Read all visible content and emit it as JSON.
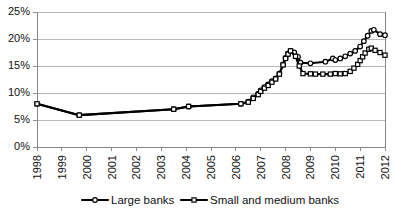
{
  "chart_data": {
    "type": "line",
    "title": "",
    "xlabel": "",
    "ylabel": "",
    "ylim": [
      0,
      25
    ],
    "ytick_labels": [
      "0%",
      "5%",
      "10%",
      "15%",
      "20%",
      "25%"
    ],
    "ytick_values": [
      0,
      5,
      10,
      15,
      20,
      25
    ],
    "xlim": [
      1998,
      2012
    ],
    "xtick_labels": [
      "1998",
      "1999",
      "2000",
      "2001",
      "2002",
      "2003",
      "2004",
      "2005",
      "2006",
      "2007",
      "2008",
      "2009",
      "2010",
      "2011",
      "2012"
    ],
    "xtick_values": [
      1998,
      1999,
      2000,
      2001,
      2002,
      2003,
      2004,
      2005,
      2006,
      2007,
      2008,
      2009,
      2010,
      2011,
      2012
    ],
    "grid": "horizontal",
    "legend_position": "bottom",
    "yunit": "percent",
    "series": [
      {
        "name": "Large banks",
        "marker": "open-circle",
        "color": "#000000",
        "points": [
          [
            1998.0,
            8.0
          ],
          [
            1999.7,
            5.9
          ],
          [
            2003.5,
            7.0
          ],
          [
            2004.1,
            7.5
          ],
          [
            2006.2,
            8.0
          ],
          [
            2006.5,
            8.4
          ],
          [
            2006.7,
            9.2
          ],
          [
            2006.9,
            9.9
          ],
          [
            2007.0,
            10.5
          ],
          [
            2007.15,
            11.1
          ],
          [
            2007.3,
            11.6
          ],
          [
            2007.45,
            12.2
          ],
          [
            2007.6,
            12.7
          ],
          [
            2007.75,
            13.6
          ],
          [
            2007.9,
            15.3
          ],
          [
            2008.0,
            16.5
          ],
          [
            2008.1,
            17.3
          ],
          [
            2008.2,
            17.8
          ],
          [
            2008.35,
            17.5
          ],
          [
            2008.5,
            16.7
          ],
          [
            2008.6,
            15.6
          ],
          [
            2009.0,
            15.5
          ],
          [
            2009.6,
            15.8
          ],
          [
            2009.9,
            16.4
          ],
          [
            2010.0,
            16.1
          ],
          [
            2010.2,
            16.4
          ],
          [
            2010.4,
            16.8
          ],
          [
            2010.6,
            17.3
          ],
          [
            2010.8,
            17.8
          ],
          [
            2011.0,
            18.6
          ],
          [
            2011.15,
            19.6
          ],
          [
            2011.3,
            20.6
          ],
          [
            2011.45,
            21.5
          ],
          [
            2011.55,
            21.7
          ],
          [
            2011.8,
            20.9
          ],
          [
            2012.0,
            20.7
          ]
        ]
      },
      {
        "name": "Small and medium  banks",
        "marker": "open-square",
        "color": "#000000",
        "points": [
          [
            1998.0,
            8.0
          ],
          [
            1999.7,
            5.9
          ],
          [
            2003.5,
            7.0
          ],
          [
            2004.1,
            7.5
          ],
          [
            2006.2,
            8.0
          ],
          [
            2006.5,
            8.3
          ],
          [
            2006.7,
            9.0
          ],
          [
            2006.9,
            9.7
          ],
          [
            2007.0,
            10.3
          ],
          [
            2007.15,
            10.9
          ],
          [
            2007.3,
            11.4
          ],
          [
            2007.45,
            12.0
          ],
          [
            2007.6,
            12.6
          ],
          [
            2007.75,
            13.5
          ],
          [
            2007.9,
            15.2
          ],
          [
            2008.0,
            16.4
          ],
          [
            2008.1,
            17.2
          ],
          [
            2008.2,
            17.8
          ],
          [
            2008.4,
            16.8
          ],
          [
            2008.55,
            15.0
          ],
          [
            2008.7,
            13.6
          ],
          [
            2009.0,
            13.55
          ],
          [
            2009.2,
            13.5
          ],
          [
            2009.5,
            13.5
          ],
          [
            2009.8,
            13.5
          ],
          [
            2010.0,
            13.6
          ],
          [
            2010.2,
            13.55
          ],
          [
            2010.4,
            13.6
          ],
          [
            2010.6,
            14.0
          ],
          [
            2010.75,
            14.6
          ],
          [
            2010.9,
            15.3
          ],
          [
            2011.0,
            16.0
          ],
          [
            2011.1,
            16.7
          ],
          [
            2011.2,
            17.4
          ],
          [
            2011.35,
            18.1
          ],
          [
            2011.45,
            18.3
          ],
          [
            2011.6,
            17.9
          ],
          [
            2011.8,
            17.5
          ],
          [
            2012.0,
            17.0
          ]
        ]
      }
    ]
  },
  "legend": {
    "items": [
      {
        "label": "Large banks",
        "marker": "open-circle"
      },
      {
        "label": "Small and medium  banks",
        "marker": "open-square"
      }
    ]
  }
}
